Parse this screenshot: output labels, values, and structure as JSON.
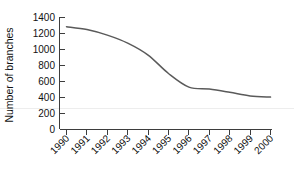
{
  "chart_data": {
    "type": "line",
    "title": "",
    "subtitle": "",
    "xlabel": "",
    "ylabel": "Number of branches",
    "x": [
      1990,
      1991,
      1992,
      1993,
      1994,
      1995,
      1996,
      1997,
      1998,
      1999,
      2000
    ],
    "categories": [
      "1990",
      "1991",
      "1992",
      "1993",
      "1994",
      "1995",
      "1996",
      "1997",
      "1998",
      "1999",
      "2000"
    ],
    "values": [
      1285,
      1250,
      1180,
      1080,
      930,
      700,
      530,
      505,
      465,
      420,
      405
    ],
    "series": [
      {
        "name": "Number of branches",
        "values": [
          1285,
          1250,
          1180,
          1080,
          930,
          700,
          530,
          505,
          465,
          420,
          405
        ]
      }
    ],
    "ylim": [
      0,
      1400
    ],
    "yticks": [
      0,
      200,
      400,
      600,
      800,
      1000,
      1200,
      1400
    ],
    "ytick_labels": [
      "0",
      "200",
      "400",
      "600",
      "800",
      "1000",
      "1200",
      "1400"
    ],
    "xtick_labels": [
      "1990",
      "1991",
      "1992",
      "1993",
      "1994",
      "1995",
      "1996",
      "1997",
      "1998",
      "1999",
      "2000"
    ],
    "xtick_rotation": 45,
    "grid": false,
    "legend": false,
    "legend_position": "none",
    "line_color": "#5a5a5a",
    "axis_color": "#3d3d3d",
    "background_color": "#ffffff"
  }
}
